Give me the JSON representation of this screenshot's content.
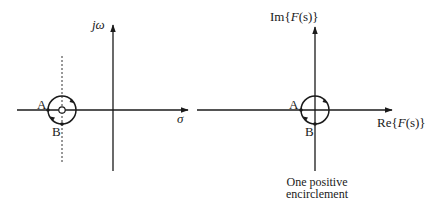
{
  "left_plot": {
    "name": "s-plane",
    "vertical_axis_label": "jω",
    "horizontal_axis_label": "σ",
    "contour_points": [
      {
        "label": "A"
      },
      {
        "label": "B"
      }
    ],
    "singularity": "zero enclosed by contour",
    "contour_direction": "counterclockwise"
  },
  "right_plot": {
    "name": "F(s)-plane",
    "vertical_axis_label_prefix": "Im{",
    "vertical_axis_label_fn": "F",
    "vertical_axis_label_arg": "(s)",
    "vertical_axis_label_suffix": "}",
    "horizontal_axis_label_prefix": "Re{",
    "horizontal_axis_label_fn": "F",
    "horizontal_axis_label_arg": "(s)",
    "horizontal_axis_label_suffix": "}",
    "contour_points": [
      {
        "label": "A"
      },
      {
        "label": "B"
      }
    ],
    "caption_line1": "One positive",
    "caption_line2": "encirclement"
  },
  "colors": {
    "ink": "#1a1a1a",
    "background": "#ffffff"
  }
}
